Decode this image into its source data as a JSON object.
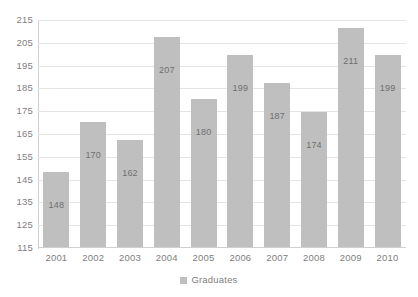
{
  "chart_data": {
    "type": "bar",
    "title": "",
    "xlabel": "",
    "ylabel": "",
    "categories": [
      "2001",
      "2002",
      "2003",
      "2004",
      "2005",
      "2006",
      "2007",
      "2008",
      "2009",
      "2010"
    ],
    "values": [
      148,
      170,
      162,
      207,
      180,
      199,
      187,
      174,
      211,
      199
    ],
    "data_labels": [
      "148",
      "170",
      "162",
      "207",
      "180",
      "199",
      "187",
      "174",
      "211",
      "199"
    ],
    "series": [
      {
        "name": "Graduates",
        "values": [
          148,
          170,
          162,
          207,
          180,
          199,
          187,
          174,
          211,
          199
        ],
        "color": "#bfbfbf"
      }
    ],
    "ylim": [
      115,
      215
    ],
    "ytick_values": [
      115,
      125,
      135,
      145,
      155,
      165,
      175,
      185,
      195,
      205,
      215
    ],
    "ytick_labels": [
      "115",
      "125",
      "135",
      "145",
      "155",
      "165",
      "175",
      "185",
      "195",
      "205",
      "215"
    ],
    "grid": true,
    "grid_color": "#e4e4e4",
    "legend": {
      "position": "bottom",
      "entries": [
        {
          "label": "Graduates",
          "marker": "square-swatch",
          "color": "#bfbfbf"
        }
      ]
    },
    "background_color": "#ffffff",
    "axis_color": "#d0d0d0",
    "text_color": "#808080"
  }
}
